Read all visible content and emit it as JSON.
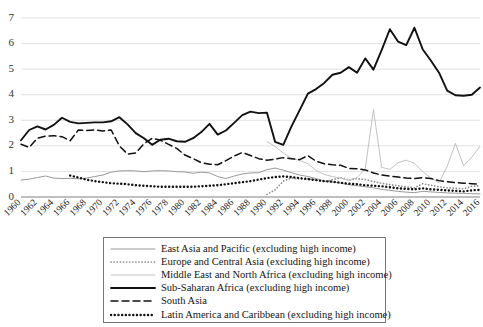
{
  "chart_data": {
    "type": "line",
    "title": "",
    "xlabel": "",
    "ylabel": "",
    "xlim": [
      1960,
      2016
    ],
    "ylim": [
      0,
      7
    ],
    "grid": true,
    "legend_position": "bottom-center",
    "yticks": [
      0,
      1,
      2,
      3,
      4,
      5,
      6,
      7
    ],
    "categories": [
      "1960",
      "1961",
      "1962",
      "1963",
      "1964",
      "1965",
      "1966",
      "1967",
      "1968",
      "1969",
      "1970",
      "1971",
      "1972",
      "1973",
      "1974",
      "1975",
      "1976",
      "1977",
      "1978",
      "1979",
      "1980",
      "1981",
      "1982",
      "1983",
      "1984",
      "1985",
      "1986",
      "1987",
      "1988",
      "1989",
      "1990",
      "1991",
      "1992",
      "1993",
      "1994",
      "1995",
      "1996",
      "1997",
      "1998",
      "1999",
      "2000",
      "2001",
      "2002",
      "2003",
      "2004",
      "2005",
      "2006",
      "2007",
      "2008",
      "2009",
      "2010",
      "2011",
      "2012",
      "2013",
      "2014",
      "2015",
      "2016"
    ],
    "xtick_labels": [
      "1960",
      "1962",
      "1964",
      "1966",
      "1968",
      "1970",
      "1972",
      "1974",
      "1976",
      "1978",
      "1980",
      "1982",
      "1984",
      "1986",
      "1988",
      "1990",
      "1992",
      "1994",
      "1996",
      "1998",
      "2000",
      "2002",
      "2004",
      "2006",
      "2008",
      "2010",
      "2012",
      "2014",
      "2016"
    ],
    "series": [
      {
        "name": "East Asia and Pacific (excluding high income)",
        "style": "thin-solid-gray",
        "color": "#9a9a9a",
        "values": [
          0.66,
          0.7,
          0.76,
          0.82,
          0.74,
          0.72,
          0.73,
          0.71,
          0.74,
          0.8,
          0.86,
          0.97,
          1.02,
          1.03,
          1.02,
          0.99,
          1.02,
          1.03,
          1.02,
          0.99,
          0.98,
          0.93,
          0.97,
          0.94,
          0.8,
          0.72,
          0.82,
          0.9,
          0.94,
          0.95,
          1.07,
          1.13,
          1.05,
          0.95,
          0.86,
          0.8,
          0.72,
          0.62,
          0.58,
          0.54,
          0.48,
          0.44,
          0.4,
          0.36,
          0.3,
          0.26,
          0.22,
          0.19,
          0.17,
          0.22,
          0.2,
          0.18,
          0.16,
          0.15,
          0.14,
          0.13,
          0.12
        ]
      },
      {
        "name": "Europe and Central Asia (excluding high income)",
        "style": "fine-dotted-gray",
        "color": "#8c8c8c",
        "values": [
          null,
          null,
          null,
          null,
          null,
          null,
          null,
          null,
          null,
          null,
          null,
          null,
          null,
          null,
          null,
          null,
          null,
          null,
          null,
          null,
          null,
          null,
          null,
          null,
          null,
          null,
          null,
          null,
          null,
          null,
          0.1,
          0.28,
          0.62,
          0.74,
          0.7,
          0.72,
          0.66,
          0.6,
          0.68,
          0.76,
          0.66,
          0.72,
          0.68,
          0.6,
          0.54,
          0.48,
          0.44,
          0.4,
          0.36,
          0.52,
          0.46,
          0.4,
          0.36,
          0.34,
          0.32,
          0.42,
          0.44
        ]
      },
      {
        "name": "Middle East and North Africa (excluding high income)",
        "style": "thin-solid-lightgray",
        "color": "#c2c2c2",
        "values": [
          null,
          null,
          null,
          null,
          null,
          null,
          null,
          null,
          null,
          null,
          null,
          null,
          null,
          null,
          null,
          null,
          null,
          null,
          null,
          null,
          null,
          null,
          null,
          null,
          null,
          null,
          null,
          null,
          null,
          null,
          2.17,
          1.98,
          1.72,
          1.51,
          1.43,
          1.3,
          1.04,
          0.88,
          0.8,
          0.74,
          0.66,
          0.76,
          1.1,
          3.42,
          1.16,
          1.08,
          1.34,
          1.44,
          1.32,
          1.0,
          0.74,
          0.56,
          1.2,
          2.1,
          1.22,
          1.56,
          1.98
        ]
      },
      {
        "name": "Sub-Saharan Africa (excluding high income)",
        "style": "thick-solid-black",
        "color": "#111111",
        "values": [
          2.22,
          2.62,
          2.76,
          2.64,
          2.82,
          3.1,
          2.94,
          2.88,
          2.9,
          2.92,
          2.92,
          2.96,
          3.12,
          2.84,
          2.5,
          2.3,
          2.04,
          2.24,
          2.28,
          2.18,
          2.16,
          2.3,
          2.54,
          2.86,
          2.44,
          2.6,
          2.9,
          3.2,
          3.34,
          3.28,
          3.3,
          2.16,
          2.04,
          2.76,
          3.4,
          4.04,
          4.22,
          4.46,
          4.78,
          4.86,
          5.08,
          4.86,
          5.42,
          4.98,
          5.74,
          6.56,
          6.08,
          5.94,
          6.62,
          5.78,
          5.34,
          4.86,
          4.16,
          3.98,
          3.96,
          4.0,
          4.28
        ]
      },
      {
        "name": "South Asia",
        "style": "dashed-black",
        "color": "#111111",
        "values": [
          2.06,
          1.94,
          2.3,
          2.38,
          2.4,
          2.36,
          2.2,
          2.62,
          2.6,
          2.62,
          2.58,
          2.62,
          2.0,
          1.68,
          1.72,
          2.08,
          2.3,
          2.22,
          2.06,
          1.9,
          1.64,
          1.5,
          1.34,
          1.28,
          1.26,
          1.42,
          1.6,
          1.74,
          1.62,
          1.5,
          1.44,
          1.48,
          1.54,
          1.5,
          1.46,
          1.62,
          1.4,
          1.3,
          1.26,
          1.24,
          1.12,
          1.1,
          1.06,
          0.94,
          0.86,
          0.82,
          0.78,
          0.74,
          0.72,
          0.76,
          0.72,
          0.64,
          0.6,
          0.56,
          0.54,
          0.52,
          0.5
        ]
      },
      {
        "name": "Latin America and Caribbean (excluding high income)",
        "style": "bold-dotted-black",
        "color": "#111111",
        "values": [
          null,
          null,
          null,
          null,
          null,
          null,
          0.84,
          0.76,
          0.68,
          0.62,
          0.58,
          0.54,
          0.52,
          0.5,
          0.46,
          0.44,
          0.42,
          0.4,
          0.4,
          0.4,
          0.4,
          0.4,
          0.42,
          0.44,
          0.46,
          0.5,
          0.54,
          0.58,
          0.62,
          0.68,
          0.74,
          0.78,
          0.8,
          0.78,
          0.74,
          0.7,
          0.66,
          0.62,
          0.6,
          0.56,
          0.52,
          0.5,
          0.46,
          0.44,
          0.42,
          0.38,
          0.34,
          0.32,
          0.3,
          0.34,
          0.3,
          0.28,
          0.26,
          0.24,
          0.22,
          0.26,
          0.28
        ]
      }
    ]
  },
  "legend": {
    "items": [
      {
        "label": "East Asia and Pacific (excluding high income)",
        "style": "thin-solid-gray",
        "color": "#9a9a9a"
      },
      {
        "label": "Europe and Central Asia (excluding high income)",
        "style": "fine-dotted-gray",
        "color": "#8c8c8c"
      },
      {
        "label": "Middle East and North Africa (excluding high income)",
        "style": "thin-solid-lightgray",
        "color": "#c2c2c2"
      },
      {
        "label": "Sub-Saharan Africa (excluding high income)",
        "style": "thick-solid-black",
        "color": "#111111"
      },
      {
        "label": "South Asia",
        "style": "dashed-black",
        "color": "#111111"
      },
      {
        "label": "Latin America and Caribbean (excluding high income)",
        "style": "bold-dotted-black",
        "color": "#111111"
      }
    ]
  },
  "colors": {
    "grid": "#d9d9d9",
    "axis": "#808080",
    "text": "#1a1a1a",
    "background": "#ffffff"
  }
}
